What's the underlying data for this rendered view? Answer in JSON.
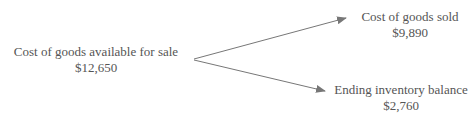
{
  "diagram": {
    "source": {
      "label": "Cost of goods available for sale",
      "value": "$12,650"
    },
    "targets": [
      {
        "label": "Cost of goods sold",
        "value": "$9,890"
      },
      {
        "label": "Ending inventory balance",
        "value": "$2,760"
      }
    ],
    "colors": {
      "text": "#555555",
      "arrow": "#777777"
    }
  }
}
